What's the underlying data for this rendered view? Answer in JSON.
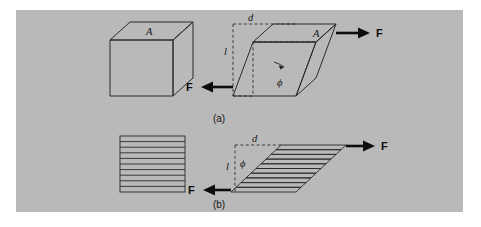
{
  "figure": {
    "background_color": "#ffffff",
    "panel_color": "#b9b9b9",
    "ink_color": "#2b2b2b",
    "caption_a": "(a)",
    "caption_b": "(b)"
  },
  "panel_a": {
    "undeformed": {
      "area_label": "A"
    },
    "sheared": {
      "area_label": "A",
      "displacement_label": "d",
      "height_label": "l",
      "angle_label": "ϕ",
      "force_right_label": "F",
      "force_left_label": "F"
    }
  },
  "panel_b": {
    "undeformed": {
      "plate_count": 10
    },
    "sheared": {
      "plate_count": 10,
      "displacement_label": "d",
      "height_label": "l",
      "angle_label": "ϕ",
      "force_right_label": "F",
      "force_left_label": "F"
    }
  },
  "diagram_meta": {
    "type": "technical-illustration",
    "subject": "shear-deformation",
    "description": "Shear stress applied to a cube and to an analogous stack of plates"
  }
}
